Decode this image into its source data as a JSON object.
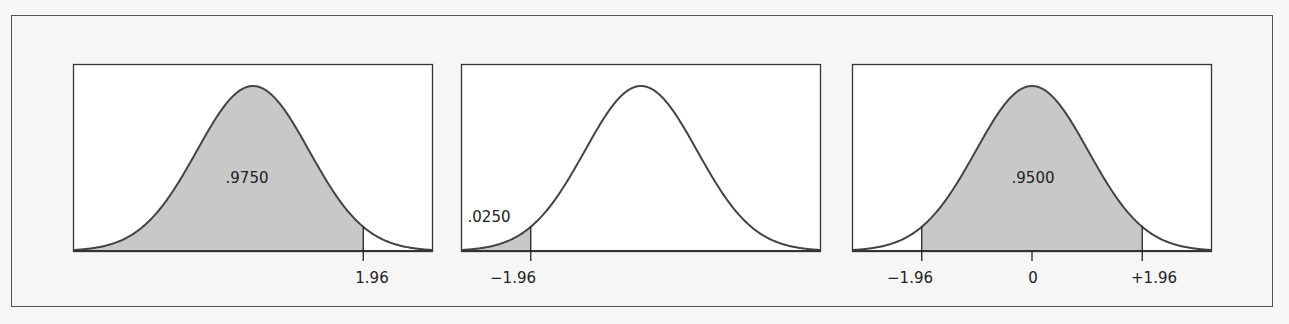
{
  "chart_data": [
    {
      "type": "area",
      "title": "",
      "distribution": "standard normal",
      "shaded_region": {
        "from": null,
        "to": 1.96
      },
      "area_label": ".9750",
      "tick_labels": [
        {
          "x": 1.96,
          "label": "1.96"
        }
      ],
      "xlim": [
        -3.2,
        3.2
      ],
      "grid": false
    },
    {
      "type": "area",
      "title": "",
      "distribution": "standard normal",
      "shaded_region": {
        "from": null,
        "to": -1.96
      },
      "area_label": ".0250",
      "tick_labels": [
        {
          "x": -1.96,
          "label": "−1.96"
        }
      ],
      "xlim": [
        -3.2,
        3.2
      ],
      "grid": false
    },
    {
      "type": "area",
      "title": "",
      "distribution": "standard normal",
      "shaded_region": {
        "from": -1.96,
        "to": 1.96
      },
      "area_label": ".9500",
      "tick_labels": [
        {
          "x": -1.96,
          "label": "−1.96"
        },
        {
          "x": 0,
          "label": "0"
        },
        {
          "x": 1.96,
          "label": "+1.96"
        }
      ],
      "xlim": [
        -3.2,
        3.2
      ],
      "grid": false
    }
  ],
  "colors": {
    "fill": "#c8c8c8",
    "curve": "#444444",
    "frame": "#333333"
  },
  "panels": [
    {
      "area_label": ".9750",
      "ticks": [
        "1.96"
      ]
    },
    {
      "area_label": ".0250",
      "ticks": [
        "−1.96"
      ]
    },
    {
      "area_label": ".9500",
      "ticks": [
        "−1.96",
        "0",
        "+1.96"
      ]
    }
  ]
}
